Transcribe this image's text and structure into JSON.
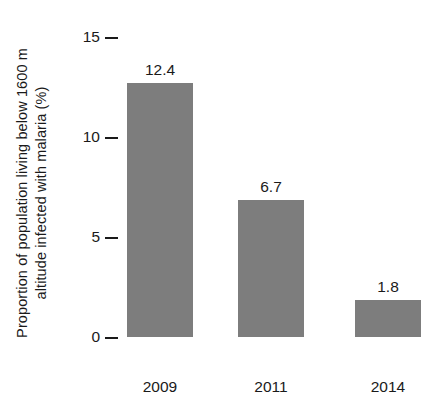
{
  "chart_data": {
    "type": "bar",
    "title": "",
    "xlabel": "",
    "ylabel_lines": [
      "Proportion of population living below 1600 m",
      "altitude infected with malaria (%)"
    ],
    "ylabel": "Proportion of population living below 1600 m altitude infected with malaria (%)",
    "categories": [
      "2009",
      "2011",
      "2014"
    ],
    "values": [
      12.4,
      6.7,
      1.8
    ],
    "value_labels": [
      "12.4",
      "6.7",
      "1.8"
    ],
    "yticks": [
      0,
      5,
      10,
      15
    ],
    "ytick_labels": [
      "0",
      "5",
      "10",
      "15"
    ],
    "ylim": [
      0,
      15
    ],
    "grid": false,
    "legend": false,
    "bar_color": "#7d7d7d",
    "text_color": "#1a1a1a",
    "background_color": "#ffffff"
  }
}
